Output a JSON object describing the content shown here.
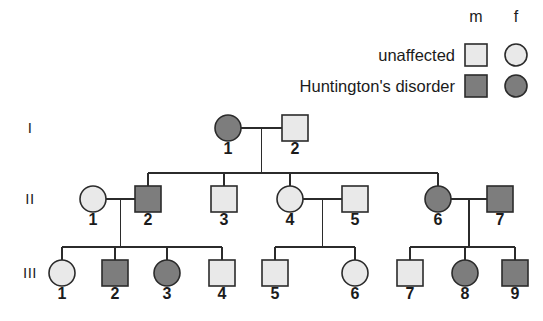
{
  "figure": {
    "kind": "pedigree-chart",
    "background_color": "#ffffff",
    "line_color": "#2b2b2b"
  },
  "legend": {
    "column_headers": {
      "male": "m",
      "female": "f"
    },
    "rows": [
      {
        "label": "unaffected",
        "fill": "#e9e9e9"
      },
      {
        "label": "Huntington's disorder",
        "fill": "#7d7d7d"
      }
    ]
  },
  "generations": [
    {
      "label": "I"
    },
    {
      "label": "II"
    },
    {
      "label": "III"
    }
  ],
  "individuals": [
    {
      "id": "I-1",
      "number": "1",
      "sex": "female",
      "affected": true,
      "generation": "I",
      "cx": 228,
      "cy": 128
    },
    {
      "id": "I-2",
      "number": "2",
      "sex": "male",
      "affected": false,
      "generation": "I",
      "cx": 295,
      "cy": 128
    },
    {
      "id": "II-1",
      "number": "1",
      "sex": "female",
      "affected": false,
      "generation": "II",
      "cx": 93,
      "cy": 199
    },
    {
      "id": "II-2",
      "number": "2",
      "sex": "male",
      "affected": true,
      "generation": "II",
      "cx": 148,
      "cy": 199
    },
    {
      "id": "II-3",
      "number": "3",
      "sex": "male",
      "affected": false,
      "generation": "II",
      "cx": 224,
      "cy": 199
    },
    {
      "id": "II-4",
      "number": "4",
      "sex": "female",
      "affected": false,
      "generation": "II",
      "cx": 290,
      "cy": 199
    },
    {
      "id": "II-5",
      "number": "5",
      "sex": "male",
      "affected": false,
      "generation": "II",
      "cx": 355,
      "cy": 199
    },
    {
      "id": "II-6",
      "number": "6",
      "sex": "female",
      "affected": true,
      "generation": "II",
      "cx": 438,
      "cy": 199
    },
    {
      "id": "II-7",
      "number": "7",
      "sex": "male",
      "affected": true,
      "generation": "II",
      "cx": 500,
      "cy": 199
    },
    {
      "id": "III-1",
      "number": "1",
      "sex": "female",
      "affected": false,
      "generation": "III",
      "cx": 62,
      "cy": 273
    },
    {
      "id": "III-2",
      "number": "2",
      "sex": "male",
      "affected": true,
      "generation": "III",
      "cx": 115,
      "cy": 273
    },
    {
      "id": "III-3",
      "number": "3",
      "sex": "female",
      "affected": true,
      "generation": "III",
      "cx": 167,
      "cy": 273
    },
    {
      "id": "III-4",
      "number": "4",
      "sex": "male",
      "affected": false,
      "generation": "III",
      "cx": 222,
      "cy": 273
    },
    {
      "id": "III-5",
      "number": "5",
      "sex": "male",
      "affected": false,
      "generation": "III",
      "cx": 275,
      "cy": 273
    },
    {
      "id": "III-6",
      "number": "6",
      "sex": "female",
      "affected": false,
      "generation": "III",
      "cx": 355,
      "cy": 273
    },
    {
      "id": "III-7",
      "number": "7",
      "sex": "male",
      "affected": false,
      "generation": "III",
      "cx": 410,
      "cy": 273
    },
    {
      "id": "III-8",
      "number": "8",
      "sex": "female",
      "affected": true,
      "generation": "III",
      "cx": 465,
      "cy": 273
    },
    {
      "id": "III-9",
      "number": "9",
      "sex": "male",
      "affected": true,
      "generation": "III",
      "cx": 515,
      "cy": 273
    }
  ],
  "matings": [
    {
      "partners": [
        "I-1",
        "I-2"
      ],
      "children": [
        "II-2",
        "II-3",
        "II-4",
        "II-6"
      ]
    },
    {
      "partners": [
        "II-1",
        "II-2"
      ],
      "children": [
        "III-1",
        "III-2",
        "III-3",
        "III-4"
      ]
    },
    {
      "partners": [
        "II-4",
        "II-5"
      ],
      "children": [
        "III-5",
        "III-6"
      ]
    },
    {
      "partners": [
        "II-6",
        "II-7"
      ],
      "children": [
        "III-7",
        "III-8",
        "III-9"
      ]
    }
  ],
  "geometry": {
    "symbol_size": 26,
    "legend_symbol_size": 22,
    "gen_label_x": 30,
    "legend_label_right_x": 455,
    "legend_male_cx": 476,
    "legend_female_cx": 516,
    "legend_header_y": 22,
    "legend_row_ys": [
      55,
      86
    ],
    "sibship_bar_offset": 26,
    "id_label_dy": 26
  }
}
